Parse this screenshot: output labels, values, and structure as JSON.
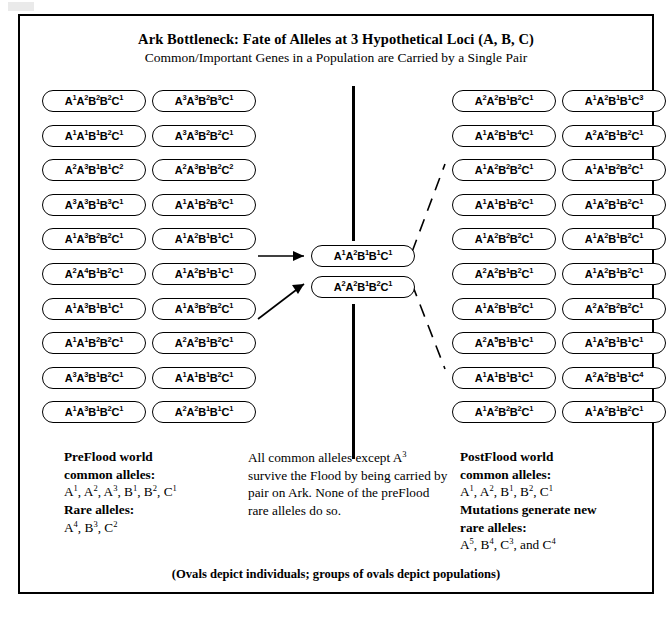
{
  "figure": {
    "main_title": "Ark Bottleneck: Fate of Alleles at 3 Hypothetical Loci (A, B, C)",
    "sub_title": "Common/Important Genes in a Population are Carried by a Single Pair",
    "footer_note": "(Ovals depict individuals; groups of ovals depict populations)",
    "line_color": "#000000",
    "background": "#ffffff"
  },
  "preflood_population": {
    "column_1": [
      "A|1|A|2|B|2|B|2|C|1",
      "A|1|A|1|B|1|B|2|C|1",
      "A|2|A|3|B|1|B|1|C|2",
      "A|3|A|3|B|1|B|3|C|1",
      "A|1|A|3|B|2|B|2|C|1",
      "A|2|A|4|B|1|B|2|C|1",
      "A|1|A|3|B|1|B|1|C|1",
      "A|1|A|1|B|2|B|2|C|1",
      "A|3|A|3|B|1|B|2|C|1",
      "A|1|A|3|B|1|B|2|C|1"
    ],
    "column_2": [
      "A|3|A|3|B|2|B|3|C|1",
      "A|3|A|3|B|2|B|2|C|1",
      "A|2|A|3|B|1|B|2|C|2",
      "A|1|A|1|B|2|B|3|C|1",
      "A|1|A|2|B|1|B|1|C|1",
      "A|1|A|2|B|1|B|1|C|1",
      "A|1|A|3|B|2|B|2|C|1",
      "A|2|A|2|B|1|B|2|C|1",
      "A|1|A|1|B|1|B|2|C|1",
      "A|2|A|2|B|1|B|1|C|1"
    ]
  },
  "ark_pair": [
    "A|1|A|2|B|1|B|1|C|1",
    "A|2|A|2|B|1|B|2|C|1"
  ],
  "postflood_population": {
    "column_3": [
      "A|2|A|2|B|1|B|2|C|1",
      "A|1|A|2|B|1|B|4|C|1",
      "A|1|A|2|B|2|B|2|C|1",
      "A|1|A|1|B|1|B|2|C|1",
      "A|1|A|2|B|2|B|2|C|1",
      "A|2|A|2|B|1|B|2|C|1",
      "A|1|A|2|B|1|B|2|C|1",
      "A|2|A|5|B|1|B|1|C|1",
      "A|1|A|1|B|1|B|1|C|1",
      "A|1|A|2|B|2|B|2|C|1"
    ],
    "column_4": [
      "A|1|A|2|B|1|B|1|C|3",
      "A|2|A|2|B|1|B|2|C|1",
      "A|1|A|1|B|2|B|2|C|1",
      "A|1|A|2|B|1|B|2|C|1",
      "A|1|A|2|B|1|B|2|C|1",
      "A|1|A|2|B|1|B|2|C|1",
      "A|2|A|2|B|2|B|2|C|1",
      "A|1|A|2|B|1|B|1|C|1",
      "A|2|A|2|B|1|B|1|C|4",
      "A|1|A|2|B|1|B|2|C|1"
    ]
  },
  "captions": {
    "preflood": {
      "heading_1": "PreFlood world",
      "heading_2": "common alleles:",
      "common_list": "A|1|, A|2|, A|3|, B|1|, B|2|, C|1|",
      "heading_3": "Rare alleles:",
      "rare_list": "A|4|, B|3|, C|2|"
    },
    "center": {
      "text": "All common alleles except A|3| survive the Flood by being carried by pair on Ark. None of the preFlood rare alleles do so."
    },
    "postflood": {
      "heading_1": "PostFlood world",
      "heading_2": "common alleles:",
      "common_list": "A|1|, A|2|, B|1|, B|2|, C|1|",
      "heading_3": "Mutations generate new",
      "heading_4": "rare alleles:",
      "rare_list": "A|5|, B|4|, C|3|, and C|4|"
    }
  }
}
